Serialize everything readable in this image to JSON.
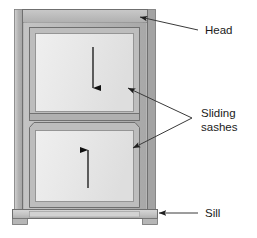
{
  "figure": {
    "type": "technical-diagram",
    "background_color": "#ffffff"
  },
  "labels": [
    {
      "id": "head",
      "text": "Head",
      "x": 205,
      "y": 33,
      "leader": "diagonal-line",
      "pointer": "arrow-left-down"
    },
    {
      "id": "sliding",
      "text": "Sliding",
      "x": 200,
      "y": 116,
      "leader": "v-shaped-double-line",
      "pointer": "arrow-left"
    },
    {
      "id": "sashes",
      "text": "sashes",
      "x": 200,
      "y": 130,
      "leader": "none",
      "pointer": "none"
    },
    {
      "id": "sill",
      "text": "Sill",
      "x": 205,
      "y": 215,
      "leader": "horizontal-line",
      "pointer": "arrow-left"
    }
  ],
  "parts": {
    "head_label": "Head",
    "sliding_sashes_label_line1": "Sliding",
    "sliding_sashes_label_line2": "sashes",
    "sill_label": "Sill"
  },
  "motion_arrows": [
    {
      "id": "upper-sash-arrow",
      "direction": "down",
      "sash": "upper",
      "x": 93,
      "y1": 48,
      "y2": 93
    },
    {
      "id": "lower-sash-arrow",
      "direction": "up",
      "sash": "lower",
      "x": 88,
      "y1": 188,
      "y2": 145
    }
  ],
  "colors": {
    "glass": "#e9e9e9",
    "glass_edge": "#dcdcdc",
    "sash_frame": "#b8b8b8",
    "outer_frame": "#b4b4b4",
    "jamb_dark": "#9c9c9c",
    "jamb_light": "#cfcfcf",
    "sill": "#c2c2c2",
    "outline": "#6e6e6e",
    "arrow": "#111111",
    "leader": "#555555",
    "text": "#1a1a1a"
  },
  "caption_cropped": "figure caption cropped at bottom edge"
}
